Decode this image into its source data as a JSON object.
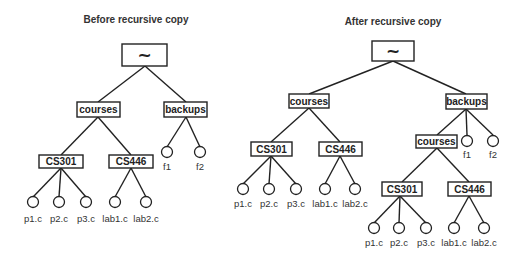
{
  "diagram": {
    "left_panel": {
      "title": "Before recursive copy",
      "root": "~",
      "dirs": {
        "courses": "courses",
        "backups": "backups",
        "cs301": "CS301",
        "cs446": "CS446"
      },
      "files": {
        "p1": "p1.c",
        "p2": "p2.c",
        "p3": "p3.c",
        "lab1": "lab1.c",
        "lab2": "lab2.c",
        "f1": "f1",
        "f2": "f2"
      }
    },
    "right_panel": {
      "title": "After recursive copy",
      "root": "~",
      "dirs": {
        "courses": "courses",
        "backups": "backups",
        "cs301": "CS301",
        "cs446": "CS446",
        "copy_courses": "courses",
        "copy_cs301": "CS301",
        "copy_cs446": "CS446"
      },
      "files": {
        "p1": "p1.c",
        "p2": "p2.c",
        "p3": "p3.c",
        "lab1": "lab1.c",
        "lab2": "lab2.c",
        "f1": "f1",
        "f2": "f2",
        "copy_p1": "p1.c",
        "copy_p2": "p2.c",
        "copy_p3": "p3.c",
        "copy_lab1": "lab1.c",
        "copy_lab2": "lab2.c"
      }
    }
  }
}
